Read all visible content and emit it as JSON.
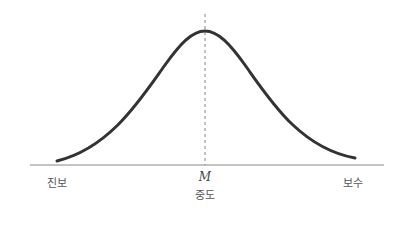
{
  "diagram": {
    "type": "normal-distribution-curve",
    "center_marker": "M",
    "labels": {
      "left": "진보",
      "center": "중도",
      "right": "보수"
    },
    "colors": {
      "curve": "#333333",
      "axis": "#888888",
      "dashed_line": "#666666",
      "label_text": "#555555"
    }
  }
}
